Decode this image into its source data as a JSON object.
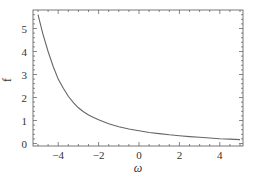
{
  "chart_data": {
    "type": "line",
    "title": "",
    "xlabel": "ω",
    "ylabel": "f",
    "xlim": [
      -5.3,
      5.1
    ],
    "ylim": [
      -0.1,
      5.8
    ],
    "grid": false,
    "legend": null,
    "x_ticks": [
      -4,
      -2,
      0,
      2,
      4
    ],
    "x_tick_labels": [
      "−4",
      "−2",
      "0",
      "2",
      "4"
    ],
    "y_ticks": [
      0,
      1,
      2,
      3,
      4,
      5
    ],
    "y_tick_labels": [
      "0",
      "1",
      "2",
      "3",
      "4",
      "5"
    ],
    "series": [
      {
        "name": "f(ω)",
        "color": "#666666",
        "x": [
          -5.0,
          -4.75,
          -4.5,
          -4.25,
          -4.0,
          -3.75,
          -3.5,
          -3.25,
          -3.0,
          -2.75,
          -2.5,
          -2.25,
          -2.0,
          -1.5,
          -1.0,
          -0.5,
          0.0,
          0.5,
          1.0,
          1.5,
          2.0,
          2.5,
          3.0,
          3.5,
          4.0,
          4.5,
          5.0
        ],
        "y": [
          5.6,
          4.75,
          4.0,
          3.35,
          2.8,
          2.4,
          2.05,
          1.78,
          1.55,
          1.38,
          1.24,
          1.13,
          1.03,
          0.86,
          0.73,
          0.63,
          0.55,
          0.48,
          0.43,
          0.38,
          0.34,
          0.3,
          0.27,
          0.24,
          0.21,
          0.19,
          0.17
        ]
      }
    ]
  }
}
